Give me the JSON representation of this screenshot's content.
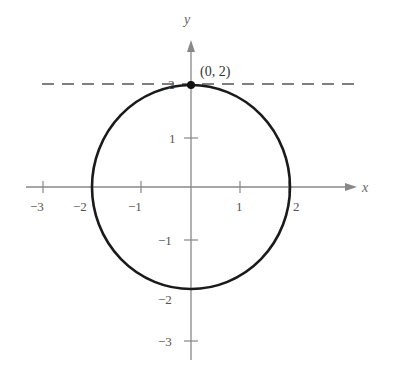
{
  "figure": {
    "axes": {
      "x_label": "x",
      "y_label": "y",
      "x_ticks": [
        {
          "value": -3,
          "label": "−3"
        },
        {
          "value": -2,
          "label": "−2"
        },
        {
          "value": -1,
          "label": "−1"
        },
        {
          "value": 1,
          "label": "1"
        },
        {
          "value": 2,
          "label": "2"
        }
      ],
      "y_ticks": [
        {
          "value": 2,
          "label": "2"
        },
        {
          "value": 1,
          "label": "1"
        },
        {
          "value": -1,
          "label": "−1"
        },
        {
          "value": -2,
          "label": "−2"
        },
        {
          "value": -3,
          "label": "−3"
        }
      ]
    },
    "curve": {
      "type": "circle",
      "center": [
        0,
        0
      ],
      "radius": 2
    },
    "tangent_line": {
      "equation": "y = 2",
      "style": "dashed"
    },
    "point": {
      "coords": [
        0,
        2
      ],
      "label": "(0, 2)"
    },
    "colors": {
      "axis": "#888888",
      "curve": "#1a1a1a",
      "dashed": "#555555",
      "text": "#555555"
    }
  }
}
